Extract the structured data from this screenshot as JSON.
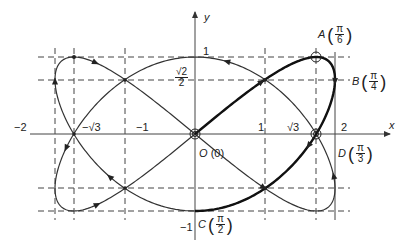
{
  "figure": {
    "title_fragment": "",
    "curve": {
      "type": "lissajous",
      "x_expr": "2 sin(2t)",
      "y_expr": "sin(3t)",
      "highlighted_range": "t in [0, pi/2]"
    },
    "axes": {
      "x_label": "x",
      "y_label": "y"
    },
    "x_ticks": [
      {
        "label": "−2",
        "value": -2
      },
      {
        "label": "−√3",
        "value": -1.732
      },
      {
        "label": "−1",
        "value": -1
      },
      {
        "label": "1",
        "value": 1
      },
      {
        "label": "√3",
        "value": 1.732
      },
      {
        "label": "2",
        "value": 2
      }
    ],
    "y_ticks": [
      {
        "label": "1",
        "value": 1
      },
      {
        "label_num": "√2",
        "label_den": "2",
        "value": 0.7071
      },
      {
        "label": "−1",
        "value": -1
      }
    ],
    "points": {
      "A": {
        "name": "A",
        "param_num": "π",
        "param_den": "6"
      },
      "B": {
        "name": "B",
        "param_num": "π",
        "param_den": "4"
      },
      "C": {
        "name": "C",
        "param_num": "π",
        "param_den": "2"
      },
      "D": {
        "name": "D",
        "param_num": "π",
        "param_den": "3"
      },
      "O": {
        "name": "O",
        "param": "(0)"
      }
    },
    "colors": {
      "curve": "#333333",
      "highlight": "#111111",
      "grid": "#444444",
      "axis": "#444444"
    }
  }
}
